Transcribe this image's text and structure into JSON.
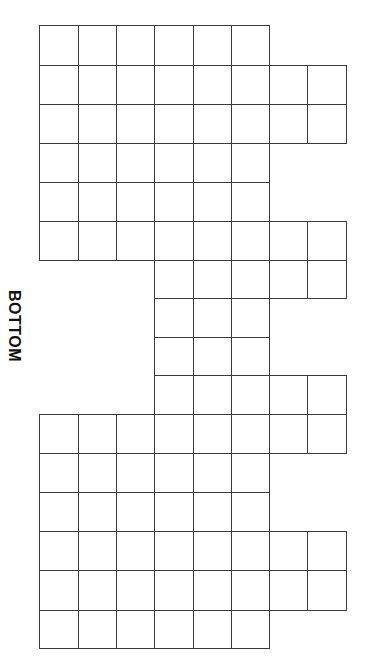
{
  "diagram": {
    "label": "BOTTOM",
    "label_orientation": "rotated-90-clockwise",
    "line_color": "#3a3a3a",
    "column_edges": [
      39,
      78,
      116,
      154,
      193,
      231,
      269,
      307,
      346
    ],
    "row_edges": [
      25,
      65,
      104,
      143,
      182,
      221,
      260,
      298,
      337,
      375,
      414,
      453,
      492,
      531,
      570,
      610,
      648
    ],
    "rows": [
      {
        "row": 0,
        "start_col": 0,
        "end_col": 5
      },
      {
        "row": 1,
        "start_col": 0,
        "end_col": 7
      },
      {
        "row": 2,
        "start_col": 0,
        "end_col": 7
      },
      {
        "row": 3,
        "start_col": 0,
        "end_col": 5
      },
      {
        "row": 4,
        "start_col": 0,
        "end_col": 5
      },
      {
        "row": 5,
        "start_col": 0,
        "end_col": 7
      },
      {
        "row": 6,
        "start_col": 3,
        "end_col": 7
      },
      {
        "row": 7,
        "start_col": 3,
        "end_col": 5
      },
      {
        "row": 8,
        "start_col": 3,
        "end_col": 5
      },
      {
        "row": 9,
        "start_col": 3,
        "end_col": 7
      },
      {
        "row": 10,
        "start_col": 0,
        "end_col": 7
      },
      {
        "row": 11,
        "start_col": 0,
        "end_col": 5
      },
      {
        "row": 12,
        "start_col": 0,
        "end_col": 5
      },
      {
        "row": 13,
        "start_col": 0,
        "end_col": 7
      },
      {
        "row": 14,
        "start_col": 0,
        "end_col": 7
      },
      {
        "row": 15,
        "start_col": 0,
        "end_col": 5
      }
    ]
  }
}
